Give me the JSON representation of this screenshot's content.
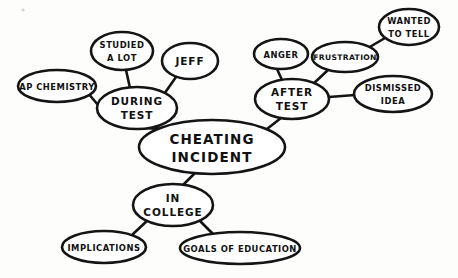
{
  "diagram": {
    "style": "hand-drawn bubble map",
    "ink_color": "#141414",
    "background_color": "#fdfdfc",
    "canvas": {
      "width": 458,
      "height": 278
    }
  },
  "nodes": {
    "central": {
      "id": "cheating-incident",
      "line1": "CHEATING",
      "line2": "INCIDENT",
      "cx": 212,
      "cy": 147,
      "rx": 73,
      "ry": 27,
      "level": "central"
    },
    "during_test": {
      "id": "during-test",
      "line1": "DURING",
      "line2": "TEST",
      "cx": 137,
      "cy": 108,
      "rx": 40,
      "ry": 21,
      "level": "branch"
    },
    "after_test": {
      "id": "after-test",
      "line1": "AFTER",
      "line2": "TEST",
      "cx": 292,
      "cy": 99,
      "rx": 37,
      "ry": 20,
      "level": "branch"
    },
    "in_college": {
      "id": "in-college",
      "line1": "IN",
      "line2": "COLLEGE",
      "cx": 173,
      "cy": 205,
      "rx": 40,
      "ry": 21,
      "level": "branch"
    },
    "ap_chemistry": {
      "id": "ap-chemistry",
      "line1": "AP CHEMISTRY",
      "cx": 57,
      "cy": 86,
      "rx": 39,
      "ry": 16,
      "level": "leaf"
    },
    "studied_a_lot": {
      "id": "studied-a-lot",
      "line1": "STUDIED",
      "line2": "A LOT",
      "cx": 122,
      "cy": 51,
      "rx": 31,
      "ry": 19,
      "level": "leaf"
    },
    "jeff": {
      "id": "jeff",
      "line1": "JEFF",
      "cx": 190,
      "cy": 61,
      "rx": 28,
      "ry": 18,
      "level": "leaf"
    },
    "anger": {
      "id": "anger",
      "line1": "ANGER",
      "cx": 281,
      "cy": 54,
      "rx": 27,
      "ry": 15,
      "level": "leaf"
    },
    "frustration": {
      "id": "frustration",
      "line1": "FRUSTRATION",
      "cx": 345,
      "cy": 57,
      "rx": 33,
      "ry": 15,
      "level": "leaf"
    },
    "wanted_to_tell": {
      "id": "wanted-to-tell",
      "line1": "WANTED",
      "line2": "TO TELL",
      "cx": 409,
      "cy": 27,
      "rx": 30,
      "ry": 18,
      "level": "leaf"
    },
    "dismissed_idea": {
      "id": "dismissed-idea",
      "line1": "DISMISSED",
      "line2": "IDEA",
      "cx": 393,
      "cy": 94,
      "rx": 39,
      "ry": 18,
      "level": "leaf"
    },
    "implications": {
      "id": "implications",
      "line1": "IMPLICATIONS",
      "cx": 104,
      "cy": 247,
      "rx": 42,
      "ry": 16,
      "level": "leaf"
    },
    "goals_of_education": {
      "id": "goals-of-education",
      "line1": "GOALS OF EDUCATION",
      "cx": 240,
      "cy": 248,
      "rx": 60,
      "ry": 16,
      "level": "leaf"
    }
  },
  "edges": [
    {
      "from": "cheating-incident",
      "to": "during-test",
      "x1": 158,
      "y1": 129,
      "x2": 146,
      "y2": 128
    },
    {
      "from": "cheating-incident",
      "to": "after-test",
      "x1": 267,
      "y1": 128,
      "x2": 281,
      "y2": 118
    },
    {
      "from": "cheating-incident",
      "to": "in-college",
      "x1": 192,
      "y1": 171,
      "x2": 181,
      "y2": 185
    },
    {
      "from": "during-test",
      "to": "ap-chemistry",
      "x1": 98,
      "y1": 104,
      "x2": 88,
      "y2": 94
    },
    {
      "from": "during-test",
      "to": "studied-a-lot",
      "x1": 130,
      "y1": 88,
      "x2": 126,
      "y2": 70
    },
    {
      "from": "during-test",
      "to": "jeff",
      "x1": 163,
      "y1": 96,
      "x2": 175,
      "y2": 77
    },
    {
      "from": "after-test",
      "to": "anger",
      "x1": 281,
      "y1": 80,
      "x2": 277,
      "y2": 69
    },
    {
      "from": "after-test",
      "to": "frustration",
      "x1": 312,
      "y1": 84,
      "x2": 327,
      "y2": 69
    },
    {
      "from": "after-test",
      "to": "dismissed-idea",
      "x1": 329,
      "y1": 96,
      "x2": 355,
      "y2": 95
    },
    {
      "from": "frustration",
      "to": "wanted-to-tell",
      "x1": 368,
      "y1": 47,
      "x2": 385,
      "y2": 38
    },
    {
      "from": "in-college",
      "to": "implications",
      "x1": 147,
      "y1": 219,
      "x2": 132,
      "y2": 234
    },
    {
      "from": "in-college",
      "to": "goals-of-education",
      "x1": 199,
      "y1": 219,
      "x2": 215,
      "y2": 236
    }
  ]
}
